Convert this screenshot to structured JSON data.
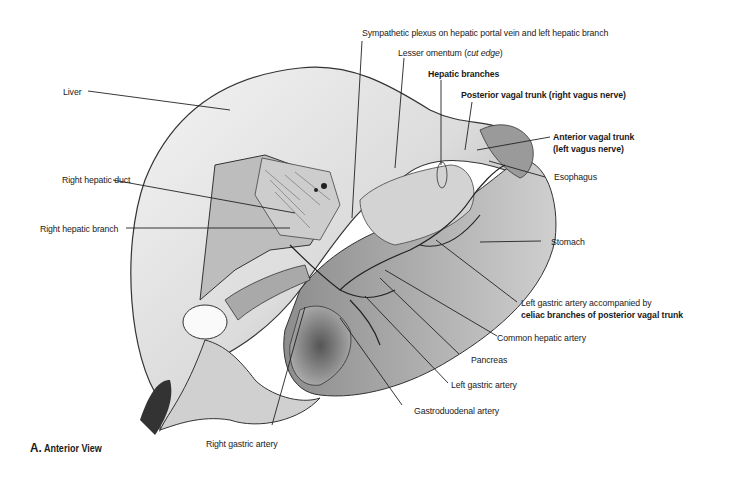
{
  "figure": {
    "caption_letter": "A.",
    "caption_text": "Anterior View"
  },
  "labels": {
    "sympathetic_plexus": "Sympathetic plexus on hepatic portal vein and left hepatic branch",
    "lesser_omentum": "Lesser omentum (",
    "lesser_omentum_italic": "cut edge",
    "lesser_omentum_close": ")",
    "hepatic_branches": "Hepatic branches",
    "posterior_vagal_trunk": "Posterior vagal trunk (right vagus nerve)",
    "anterior_vagal_trunk_1": "Anterior vagal trunk",
    "anterior_vagal_trunk_2": "(left vagus nerve)",
    "esophagus": "Esophagus",
    "stomach": "Stomach",
    "left_gastric_accompanied_1": "Left gastric artery accompanied by",
    "left_gastric_accompanied_2": "celiac branches of posterior vagal trunk",
    "common_hepatic_artery": "Common hepatic artery",
    "pancreas": "Pancreas",
    "left_gastric_artery": "Left gastric artery",
    "gastroduodenal_artery": "Gastroduodenal artery",
    "right_gastric_artery": "Right gastric artery",
    "liver": "Liver",
    "right_hepatic_duct": "Right hepatic duct",
    "right_hepatic_branch": "Right hepatic branch"
  }
}
